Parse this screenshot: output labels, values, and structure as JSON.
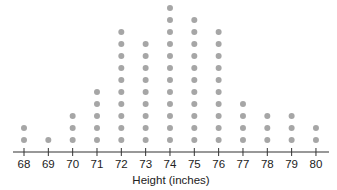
{
  "chart_data": {
    "type": "dot",
    "title": "",
    "xlabel": "Height (inches)",
    "ylabel": "",
    "categories": [
      68,
      69,
      70,
      71,
      72,
      73,
      74,
      75,
      76,
      77,
      78,
      79,
      80
    ],
    "values": [
      2,
      1,
      3,
      5,
      10,
      9,
      12,
      11,
      10,
      4,
      3,
      3,
      2
    ],
    "tick_labels": [
      "68",
      "69",
      "70",
      "71",
      "72",
      "73",
      "74",
      "75",
      "76",
      "77",
      "78",
      "79",
      "80"
    ],
    "total": 75,
    "grid": false,
    "legend": null,
    "colors": {
      "dot": "#a6a6a6",
      "axis": "#333333",
      "text": "#222222"
    }
  }
}
